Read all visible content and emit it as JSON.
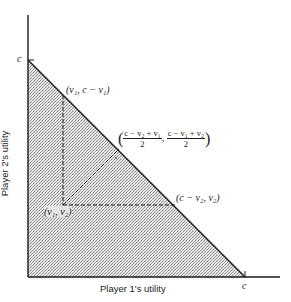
{
  "diagram": {
    "type": "utility-possibility-frontier",
    "x_axis_label": "Player 1's utility",
    "y_axis_label": "Player 2's utility",
    "x_intercept_label": "c",
    "y_intercept_label": "c",
    "points": {
      "top": "(v₁, c − v₁)",
      "threat": "(v₁, v₂)",
      "right": "(c − v₂, v₂)",
      "midpoint_x_num": "c − v₂ + v₁",
      "midpoint_y_num": "c − v₁ + v₂",
      "midpoint_den": "2"
    },
    "colors": {
      "line": "#1a1a1a",
      "shade": "#c8c8c8",
      "background": "#ffffff"
    }
  }
}
